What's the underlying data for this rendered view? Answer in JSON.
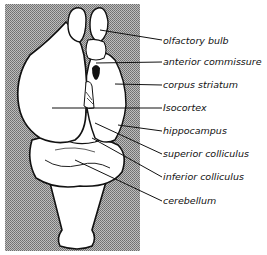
{
  "figure": {
    "type": "anatomical-diagram",
    "background_color": "#9a9a9a",
    "labels": [
      {
        "text": "olfactory bulb",
        "x": 163,
        "y": 36
      },
      {
        "text": "anterior commissure",
        "x": 163,
        "y": 57
      },
      {
        "text": "corpus striatum",
        "x": 163,
        "y": 80
      },
      {
        "text": "Isocortex",
        "x": 163,
        "y": 103
      },
      {
        "text": "hippocampus",
        "x": 163,
        "y": 126
      },
      {
        "text": "superior colliculus",
        "x": 163,
        "y": 149
      },
      {
        "text": "inferior colliculus",
        "x": 163,
        "y": 172
      },
      {
        "text": "cerebellum",
        "x": 163,
        "y": 196
      }
    ]
  }
}
